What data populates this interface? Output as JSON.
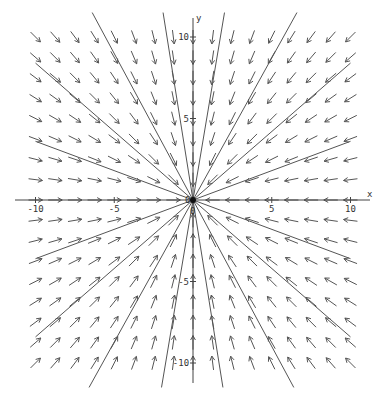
{
  "chart_data": {
    "type": "vector-field",
    "title": "",
    "xlabel": "x",
    "ylabel": "y",
    "xlim": [
      -10,
      10
    ],
    "ylim": [
      -10,
      10
    ],
    "x_ticks": [
      -10,
      -5,
      5,
      10
    ],
    "y_ticks": [
      10,
      5,
      -5,
      -10
    ],
    "origin_label": "0",
    "field": "dx/dt = -x, dy/dt = -y (all vectors point toward origin)",
    "grid": {
      "x_min": -10,
      "x_max": 10,
      "y_min": -10,
      "y_max": 10,
      "count": 17
    },
    "solution_lines_through_origin": [
      {
        "slope_desc": "steep",
        "end": [
          -6.4,
          11.5
        ]
      },
      {
        "slope_desc": "near-vertical",
        "end": [
          -1.9,
          11.5
        ]
      },
      {
        "slope_desc": "near-vertical",
        "end": [
          2.0,
          11.5
        ]
      },
      {
        "slope_desc": "steep",
        "end": [
          6.6,
          11.5
        ]
      },
      {
        "slope_desc": "shallow",
        "end": [
          -10,
          8.4
        ]
      },
      {
        "slope_desc": "shallow",
        "end": [
          -10,
          3.6
        ]
      },
      {
        "slope_desc": "shallow",
        "end": [
          10,
          8.4
        ]
      },
      {
        "slope_desc": "shallow",
        "end": [
          10,
          3.6
        ]
      }
    ],
    "equilibrium_point": [
      0,
      0
    ]
  },
  "axes": {
    "x_label": "x",
    "y_label": "y",
    "origin": "0",
    "x_tick_labels": [
      "-10",
      "-5",
      "5",
      "10"
    ],
    "y_tick_labels": [
      "10",
      "5",
      "-5",
      "-10"
    ]
  }
}
